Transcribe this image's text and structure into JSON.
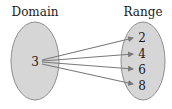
{
  "diagram": {
    "type": "mapping",
    "domain": {
      "title": "Domain",
      "values": [
        "3"
      ]
    },
    "range": {
      "title": "Range",
      "values": [
        "2",
        "4",
        "6",
        "8"
      ]
    },
    "mappings": [
      {
        "from": "3",
        "to": "2"
      },
      {
        "from": "3",
        "to": "4"
      },
      {
        "from": "3",
        "to": "6"
      },
      {
        "from": "3",
        "to": "8"
      }
    ],
    "colors": {
      "ellipse_fill": "#d6d6d6",
      "ellipse_stroke": "#8f8f8f",
      "arrow": "#7a7a7a",
      "text": "#1a1a1a"
    }
  }
}
